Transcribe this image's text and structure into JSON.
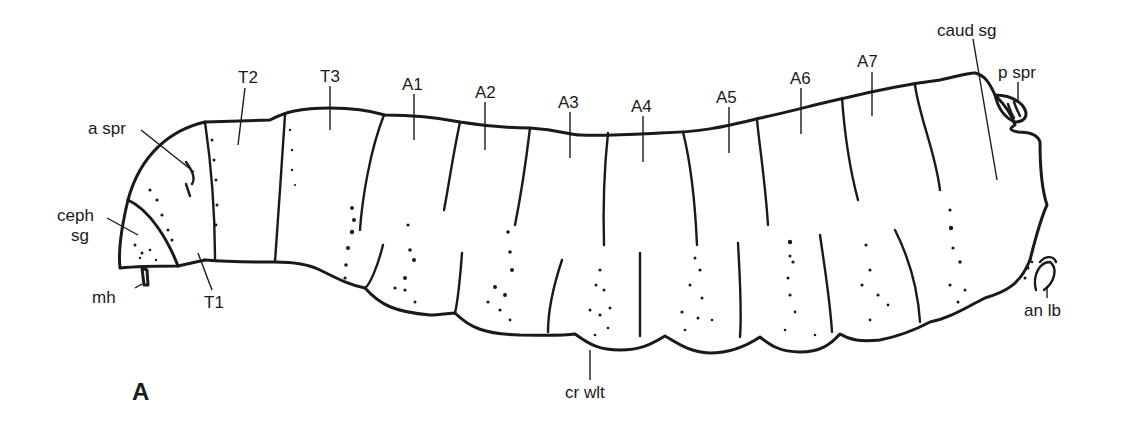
{
  "figure": {
    "panel_label": "A",
    "labels": {
      "a_spr": "a spr",
      "ceph_sg_1": "ceph",
      "ceph_sg_2": "sg",
      "mh": "mh",
      "T1": "T1",
      "T2": "T2",
      "T3": "T3",
      "A1": "A1",
      "A2": "A2",
      "A3": "A3",
      "A4": "A4",
      "A5": "A5",
      "A6": "A6",
      "A7": "A7",
      "caud_sg": "caud sg",
      "p_spr": "p spr",
      "an_lb": "an lb",
      "cr_wlt": "cr wlt"
    },
    "colors": {
      "ink": "#1a1a1a",
      "background": "#ffffff"
    }
  }
}
